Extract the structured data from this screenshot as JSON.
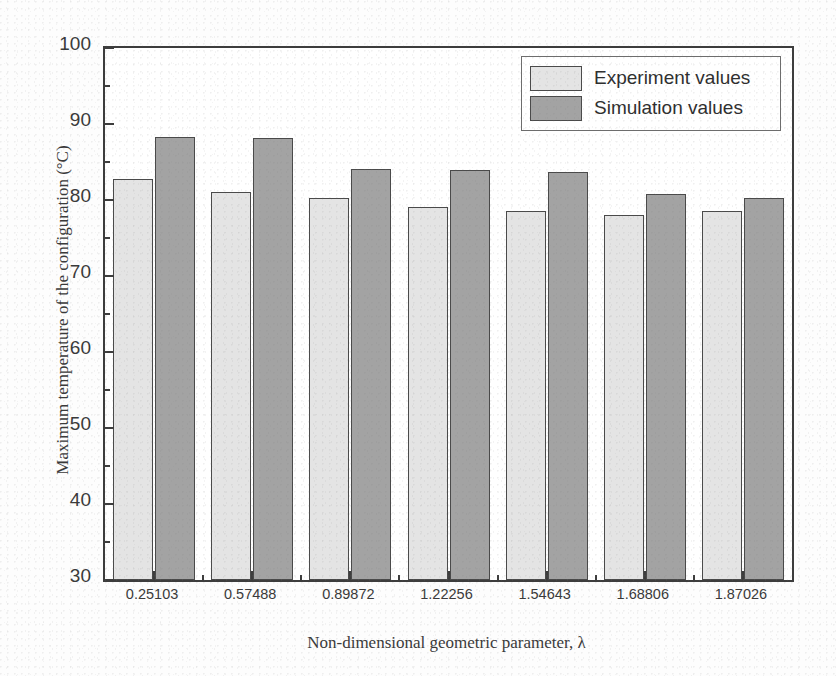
{
  "chart_data": {
    "type": "bar",
    "title": "",
    "xlabel": "Non-dimensional geometric parameter, λ",
    "ylabel": "Maximum temperature of the configuration (°C)",
    "categories": [
      "0.25103",
      "0.57488",
      "0.89872",
      "1.22256",
      "1.54643",
      "1.68806",
      "1.87026"
    ],
    "series": [
      {
        "name": "Experiment values",
        "color": "#e4e4e4",
        "values": [
          82.8,
          81.1,
          80.2,
          79.1,
          78.6,
          78.0,
          78.6
        ]
      },
      {
        "name": "Simulation values",
        "color": "#a3a3a3",
        "values": [
          88.3,
          88.2,
          84.1,
          83.9,
          83.7,
          80.8,
          80.2
        ]
      }
    ],
    "ylim": [
      30,
      100
    ],
    "ytick_labels": [
      "30",
      "40",
      "50",
      "60",
      "70",
      "80",
      "90",
      "100"
    ],
    "ytick_values": [
      30,
      40,
      50,
      60,
      70,
      80,
      90,
      100
    ],
    "yminor_values": [
      35,
      45,
      55,
      65,
      75,
      85,
      95
    ],
    "grid": false,
    "legend_position": "top-right"
  },
  "legend": {
    "entries": [
      {
        "label": "Experiment values"
      },
      {
        "label": "Simulation values"
      }
    ]
  }
}
